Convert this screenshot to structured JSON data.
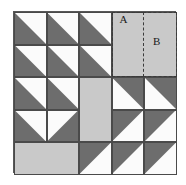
{
  "figure": {
    "grid": {
      "rows": 5,
      "cols": 5,
      "cell_px": 32.5
    },
    "colors": {
      "light_gray": "#c9c9c9",
      "dark_gray": "#6d6d6d",
      "white": "#fbfbfb",
      "outline": "#4a4a4a",
      "frame": "#585858",
      "dashed": "#3b3b3b",
      "background": "#ffffff",
      "label_text": "#1a1a1a"
    },
    "labels": [
      {
        "id": "A",
        "text": "A",
        "row": 1,
        "col": 4
      },
      {
        "id": "B",
        "text": "B",
        "row": 1,
        "col": 5
      }
    ],
    "regions": [
      {
        "id": "region-a",
        "label": "A",
        "style": "dashed",
        "row": 1,
        "col": 4,
        "row_span": 2,
        "col_span": 1
      },
      {
        "id": "region-b",
        "label": "B",
        "style": "dashed",
        "row": 1,
        "col": 4,
        "row_span": 2,
        "col_span": 2
      }
    ],
    "solid_blocks": [
      {
        "id": "center-square",
        "fill": "light_gray",
        "row": 3,
        "col": 3,
        "row_span": 2,
        "col_span": 1
      },
      {
        "id": "b-square",
        "fill": "light_gray",
        "row": 1,
        "col": 4,
        "row_span": 2,
        "col_span": 2,
        "label": "B"
      },
      {
        "id": "bottom-left-square",
        "fill": "light_gray",
        "row": 5,
        "col": 1,
        "row_span": 1,
        "col_span": 2
      }
    ],
    "cells": [
      {
        "row": 1,
        "col": 1,
        "type": "triangle",
        "dark_corner": "bottom-right"
      },
      {
        "row": 1,
        "col": 2,
        "type": "triangle",
        "dark_corner": "bottom-right"
      },
      {
        "row": 1,
        "col": 3,
        "type": "triangle",
        "dark_corner": "bottom-right"
      },
      {
        "row": 1,
        "col": 4,
        "type": "triangle",
        "dark_corner": "bottom-right",
        "label": "A"
      },
      {
        "row": 1,
        "col": 5,
        "type": "solid",
        "fill": "light_gray",
        "label": "B"
      },
      {
        "row": 2,
        "col": 1,
        "type": "triangle",
        "dark_corner": "bottom-right"
      },
      {
        "row": 2,
        "col": 2,
        "type": "triangle",
        "dark_corner": "bottom-right"
      },
      {
        "row": 2,
        "col": 3,
        "type": "triangle",
        "dark_corner": "bottom-right"
      },
      {
        "row": 2,
        "col": 4,
        "type": "triangle",
        "dark_corner": "bottom-right"
      },
      {
        "row": 2,
        "col": 5,
        "type": "solid",
        "fill": "light_gray"
      },
      {
        "row": 3,
        "col": 1,
        "type": "triangle",
        "dark_corner": "bottom-right"
      },
      {
        "row": 3,
        "col": 2,
        "type": "triangle",
        "dark_corner": "bottom-right"
      },
      {
        "row": 3,
        "col": 3,
        "type": "solid",
        "fill": "light_gray"
      },
      {
        "row": 3,
        "col": 4,
        "type": "triangle",
        "dark_corner": "top-right"
      },
      {
        "row": 3,
        "col": 5,
        "type": "triangle",
        "dark_corner": "top-right"
      },
      {
        "row": 4,
        "col": 1,
        "type": "triangle",
        "dark_corner": "bottom-right"
      },
      {
        "row": 4,
        "col": 2,
        "type": "triangle",
        "dark_corner": "bottom-left"
      },
      {
        "row": 4,
        "col": 3,
        "type": "solid",
        "fill": "light_gray"
      },
      {
        "row": 4,
        "col": 4,
        "type": "triangle",
        "dark_corner": "top-left"
      },
      {
        "row": 4,
        "col": 5,
        "type": "triangle",
        "dark_corner": "top-left"
      },
      {
        "row": 5,
        "col": 1,
        "type": "solid",
        "fill": "light_gray"
      },
      {
        "row": 5,
        "col": 2,
        "type": "solid",
        "fill": "light_gray"
      },
      {
        "row": 5,
        "col": 3,
        "type": "triangle",
        "dark_corner": "top-left"
      },
      {
        "row": 5,
        "col": 4,
        "type": "triangle",
        "dark_corner": "top-left"
      },
      {
        "row": 5,
        "col": 5,
        "type": "triangle",
        "dark_corner": "top-left"
      }
    ]
  }
}
